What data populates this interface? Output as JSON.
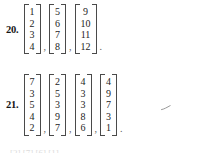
{
  "document": {
    "kind": "textbook-exercise-excerpt",
    "background_color": "#ffffff",
    "ink_color": "#232323"
  },
  "problems": [
    {
      "number": "20.",
      "vectors": [
        {
          "entries": [
            "1",
            "2",
            "3",
            "4"
          ]
        },
        {
          "entries": [
            "5",
            "6",
            "7",
            "8"
          ]
        },
        {
          "entries": [
            "9",
            "10",
            "11",
            "12"
          ]
        }
      ],
      "separators": [
        ",",
        ","
      ],
      "trailing_mark": "."
    },
    {
      "number": "21.",
      "vectors": [
        {
          "entries": [
            "7",
            "3",
            "5",
            "4",
            "2"
          ]
        },
        {
          "entries": [
            "2",
            "5",
            "3",
            "9",
            "7"
          ]
        },
        {
          "entries": [
            "4",
            "3",
            "3",
            "8",
            "6"
          ]
        },
        {
          "entries": [
            "4",
            "9",
            "7",
            "3",
            "1"
          ]
        }
      ],
      "separators": [
        ",",
        ",",
        ","
      ],
      "trailing_mark": "."
    }
  ],
  "artifacts": {
    "stray_mark_name": "scan-smudge",
    "bottom_bleed_text": "[2]    [7]    [6]    [1]"
  }
}
